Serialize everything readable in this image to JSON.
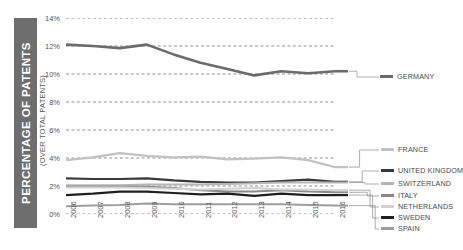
{
  "axis_title": {
    "main": "PERCENTAGE OF PATENTS",
    "sub": "(OVER TOTAL PATENTS)"
  },
  "colors": {
    "axis_block": "#6e6e6e",
    "grid": "#777777",
    "text": "#4a4a4a"
  },
  "chart_data": {
    "type": "line",
    "title": "",
    "xlabel": "",
    "ylabel": "PERCENTAGE OF PATENTS (OVER TOTAL PATENTS)",
    "categories": [
      "2006",
      "2007",
      "2008",
      "2009",
      "2010",
      "2011",
      "2012",
      "2013",
      "2014",
      "2015",
      "2016"
    ],
    "ytick_labels": [
      "0%",
      "2%",
      "4%",
      "6%",
      "8%",
      "10%",
      "12%",
      "14%"
    ],
    "ytick_values": [
      0,
      2,
      4,
      6,
      8,
      10,
      12,
      14
    ],
    "ylim": [
      0,
      14
    ],
    "grid": "horizontal-dashed",
    "legend_position": "right",
    "series": [
      {
        "name": "GERMANY",
        "color": "#6b6b6b",
        "width": 2.6,
        "values": [
          12.1,
          12.0,
          11.85,
          12.1,
          11.4,
          10.8,
          10.35,
          9.9,
          10.2,
          10.05,
          10.2
        ]
      },
      {
        "name": "FRANCE",
        "color": "#c2c2c2",
        "width": 2.2,
        "values": [
          3.85,
          4.05,
          4.35,
          4.15,
          4.05,
          4.1,
          3.9,
          3.95,
          4.05,
          3.85,
          3.35
        ]
      },
      {
        "name": "UNITED KINGDOM",
        "color": "#3a3a3a",
        "width": 2.2,
        "values": [
          2.55,
          2.5,
          2.5,
          2.55,
          2.4,
          2.3,
          2.25,
          2.25,
          2.35,
          2.45,
          2.3
        ]
      },
      {
        "name": "SWITZERLAND",
        "color": "#b5b5b5",
        "width": 2.0,
        "values": [
          2.05,
          2.05,
          2.05,
          2.1,
          2.1,
          2.1,
          2.15,
          2.2,
          2.25,
          2.25,
          2.25
        ]
      },
      {
        "name": "ITALY",
        "color": "#8a8a8a",
        "width": 2.0,
        "values": [
          1.95,
          1.95,
          1.95,
          1.95,
          1.85,
          1.7,
          1.6,
          1.6,
          1.7,
          1.6,
          1.55
        ]
      },
      {
        "name": "NETHERLANDS",
        "color": "#d2d2d2",
        "width": 2.0,
        "values": [
          1.9,
          1.9,
          1.9,
          1.85,
          1.8,
          1.75,
          1.8,
          1.85,
          1.75,
          1.75,
          1.7
        ]
      },
      {
        "name": "SWEDEN",
        "color": "#1f1f1f",
        "width": 2.2,
        "values": [
          1.35,
          1.45,
          1.6,
          1.6,
          1.5,
          1.4,
          1.45,
          1.3,
          1.45,
          1.35,
          1.35
        ]
      },
      {
        "name": "SPAIN",
        "color": "#9e9e9e",
        "width": 2.0,
        "values": [
          0.55,
          0.6,
          0.65,
          0.75,
          0.7,
          0.7,
          0.7,
          0.7,
          0.7,
          0.65,
          0.6
        ]
      }
    ]
  },
  "legend": {
    "items": [
      {
        "label": "GERMANY",
        "color": "#6b6b6b"
      },
      {
        "label": "FRANCE",
        "color": "#c2c2c2"
      },
      {
        "label": "UNITED KINGDOM",
        "color": "#3a3a3a"
      },
      {
        "label": "SWITZERLAND",
        "color": "#b5b5b5"
      },
      {
        "label": "ITALY",
        "color": "#8a8a8a"
      },
      {
        "label": "NETHERLANDS",
        "color": "#d2d2d2"
      },
      {
        "label": "SWEDEN",
        "color": "#1f1f1f"
      },
      {
        "label": "SPAIN",
        "color": "#9e9e9e"
      }
    ]
  }
}
